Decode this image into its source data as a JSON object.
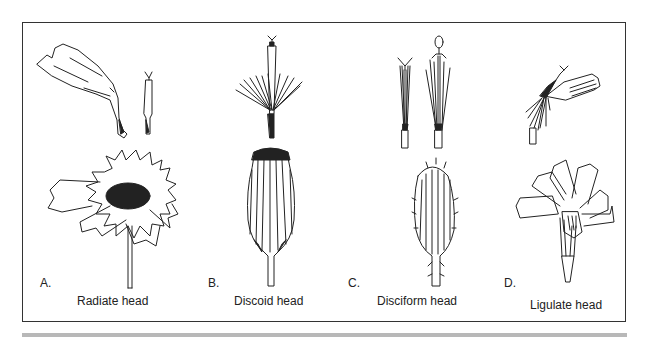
{
  "figure": {
    "panels": [
      {
        "letter": "A.",
        "caption": "Radiate head",
        "parts": [
          "ray-floret",
          "disc-floret",
          "radiate-flower-head"
        ]
      },
      {
        "letter": "B.",
        "caption": "Discoid head",
        "parts": [
          "disc-floret-with-pappus",
          "discoid-flower-head"
        ]
      },
      {
        "letter": "C.",
        "caption": "Disciform head",
        "parts": [
          "pistillate-floret",
          "perfect-floret",
          "disciform-flower-head"
        ]
      },
      {
        "letter": "D.",
        "caption": "Ligulate head",
        "parts": [
          "ligulate-floret",
          "ligulate-flower-head"
        ]
      }
    ],
    "colors": {
      "line": "#222222",
      "frame": "#333333",
      "rule": "#b8b8b8",
      "background": "#ffffff"
    }
  }
}
